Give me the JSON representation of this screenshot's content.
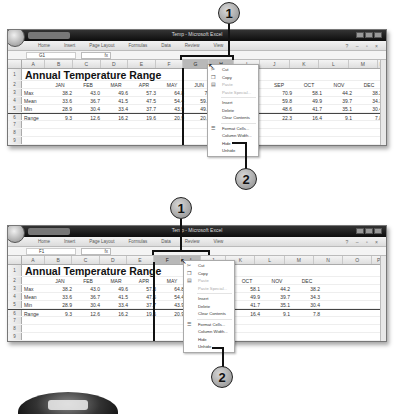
{
  "callouts": [
    "1",
    "2"
  ],
  "window": {
    "title": "Temp - Microsoft Excel",
    "ribbon_tabs": [
      "Home",
      "Insert",
      "Page Layout",
      "Formulas",
      "Data",
      "Review",
      "View"
    ],
    "fx_label": "fx"
  },
  "sheet": {
    "title": "Annual Temperature Range",
    "row_numbers": [
      "1",
      "2",
      "3",
      "4",
      "5",
      "6",
      "7",
      "8",
      "9",
      "10",
      "11"
    ],
    "months": [
      "JAN",
      "FEB",
      "MAR",
      "APR",
      "MAY",
      "JUN",
      "JUL",
      "AUG",
      "SEP",
      "OCT",
      "NOV",
      "DEC"
    ],
    "rows": [
      {
        "label": "Max",
        "values": [
          "38.2",
          "43.0",
          "49.6",
          "57.3",
          "64.8",
          "70",
          "",
          "",
          "70.9",
          "58.1",
          "44.2",
          "38.2"
        ]
      },
      {
        "label": "Mean",
        "values": [
          "33.6",
          "36.7",
          "41.5",
          "47.5",
          "54.4",
          "59.7",
          "",
          "",
          "59.8",
          "49.9",
          "39.7",
          "34.3"
        ]
      },
      {
        "label": "Min",
        "values": [
          "28.9",
          "30.4",
          "33.4",
          "37.7",
          "43.9",
          "49.4",
          "",
          "",
          "48.6",
          "41.7",
          "35.1",
          "30.4"
        ]
      },
      {
        "label": "Range",
        "values": [
          "9.3",
          "12.6",
          "16.2",
          "19.6",
          "20.9",
          "20.6",
          "",
          "",
          "22.3",
          "16.4",
          "9.1",
          "7.8"
        ]
      }
    ]
  },
  "context_menu": [
    {
      "label": "Cut",
      "icon": "scissors-icon",
      "glyph": "✂",
      "disabled": false
    },
    {
      "label": "Copy",
      "icon": "copy-icon",
      "glyph": "❐",
      "disabled": false
    },
    {
      "label": "Paste",
      "icon": "paste-icon",
      "glyph": "📋",
      "disabled": true
    },
    {
      "label": "Paste Special...",
      "icon": "",
      "glyph": "",
      "disabled": true
    },
    {
      "label": "Insert",
      "icon": "",
      "glyph": "",
      "disabled": false
    },
    {
      "label": "Delete",
      "icon": "",
      "glyph": "",
      "disabled": false
    },
    {
      "label": "Clear Contents",
      "icon": "",
      "glyph": "",
      "disabled": false
    },
    {
      "label": "Format Cells...",
      "icon": "format-cells-icon",
      "glyph": "☰",
      "disabled": false
    },
    {
      "label": "Column Width...",
      "icon": "",
      "glyph": "",
      "disabled": false
    },
    {
      "label": "Hide",
      "icon": "",
      "glyph": "",
      "disabled": false
    },
    {
      "label": "Unhide",
      "icon": "",
      "glyph": "",
      "disabled": false
    }
  ],
  "screens": [
    {
      "name_box": "G1",
      "columns": [
        "A",
        "B",
        "C",
        "D",
        "E",
        "F",
        "G",
        "H",
        "I",
        "J",
        "K",
        "L",
        "M",
        "N"
      ],
      "selected_columns": [
        "G",
        "H"
      ],
      "hidden_note": "columns G-H selected before hiding"
    },
    {
      "name_box": "F1",
      "columns": [
        "A",
        "B",
        "C",
        "D",
        "E",
        "F",
        "I",
        "J",
        "K",
        "L",
        "M",
        "N",
        "O",
        "P"
      ],
      "selected_columns": [
        "F",
        "I"
      ],
      "visible_months": [
        "JAN",
        "FEB",
        "MAR",
        "APR",
        "MAY",
        "OCT",
        "NOV",
        "DEC"
      ]
    }
  ]
}
